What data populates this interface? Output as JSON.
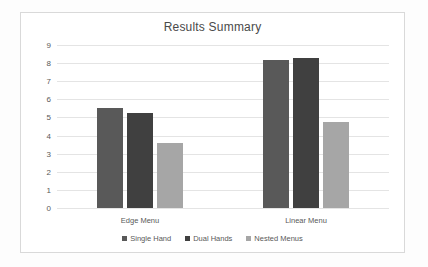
{
  "chart_data": {
    "type": "bar",
    "title": "Results Summary",
    "xlabel": "",
    "ylabel": "",
    "categories": [
      "Edge Menu",
      "Linear Menu"
    ],
    "series": [
      {
        "name": "Single Hand",
        "color": "#595959",
        "values": [
          5.5,
          8.2
        ]
      },
      {
        "name": "Dual Hands",
        "color": "#404040",
        "values": [
          5.25,
          8.3
        ]
      },
      {
        "name": "Nested Menus",
        "color": "#a6a6a6",
        "values": [
          3.6,
          4.75
        ]
      }
    ],
    "ylim": [
      0,
      9
    ],
    "ytick_step": 1,
    "yticks": [
      "9",
      "8",
      "7",
      "6",
      "5",
      "4",
      "3",
      "2",
      "1",
      "0"
    ],
    "grid": true,
    "legend_position": "bottom",
    "plot_background": "#ffffff",
    "gridline_color": "#e4e4e4",
    "frame_border_color": "#d9d9d9"
  }
}
